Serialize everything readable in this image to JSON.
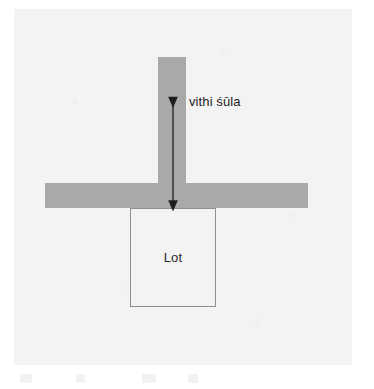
{
  "figure": {
    "name": "vithi-shula-site-diagram",
    "background_color": "#ffffff",
    "panel_color": "#f3f3f3",
    "road_color": "#a9a9a9",
    "lot_border_color": "#8f8f8f",
    "arrow_color": "#1e1e1e",
    "text_color": "#1e1e1e"
  },
  "labels": {
    "road_label": "vithi śūla",
    "lot_label": "Lot"
  },
  "elements": {
    "vertical_road": {
      "name": "vertical-road",
      "x": 158,
      "y": 57,
      "width": 28,
      "height": 151
    },
    "horizontal_road": {
      "name": "horizontal-road",
      "x": 45,
      "y": 183,
      "width": 263,
      "height": 25
    },
    "lot": {
      "name": "lot-rectangle",
      "x": 130,
      "y": 208,
      "width": 86,
      "height": 99
    },
    "axis_arrow": {
      "name": "double-headed-axis-arrow",
      "x": 173,
      "y_top": 96,
      "y_bottom": 208,
      "heads": "both"
    }
  },
  "page_bleed": {
    "marks": [
      {
        "left": 6,
        "width": 12
      },
      {
        "left": 62,
        "width": 9
      },
      {
        "left": 128,
        "width": 14
      },
      {
        "left": 174,
        "width": 10
      }
    ]
  }
}
